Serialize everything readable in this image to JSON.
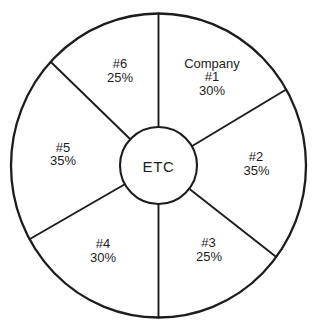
{
  "figure": {
    "background_color": "#ffffff",
    "line_color": "#1c1c1c",
    "text_color": "#1c1c1c"
  },
  "chart_data": {
    "type": "pie",
    "title": "",
    "center_label": "ETC",
    "legend_position": "none",
    "grid": false,
    "slices": [
      {
        "label": "Company #1",
        "label_lines": [
          "Company",
          "#1"
        ],
        "percent_label": "30%",
        "value": 30,
        "position": "top-right"
      },
      {
        "label": "#2",
        "label_lines": [
          "#2"
        ],
        "percent_label": "35%",
        "value": 35,
        "position": "right"
      },
      {
        "label": "#3",
        "label_lines": [
          "#3"
        ],
        "percent_label": "25%",
        "value": 25,
        "position": "bottom-right"
      },
      {
        "label": "#4",
        "label_lines": [
          "#4"
        ],
        "percent_label": "30%",
        "value": 30,
        "position": "bottom-left"
      },
      {
        "label": "#5",
        "label_lines": [
          "#5"
        ],
        "percent_label": "35%",
        "value": 35,
        "position": "left"
      },
      {
        "label": "#6",
        "label_lines": [
          "#6"
        ],
        "percent_label": "25%",
        "value": 25,
        "position": "top-left"
      }
    ],
    "divider_angles_deg": [
      -90,
      -30,
      37,
      90,
      151,
      -137
    ]
  }
}
